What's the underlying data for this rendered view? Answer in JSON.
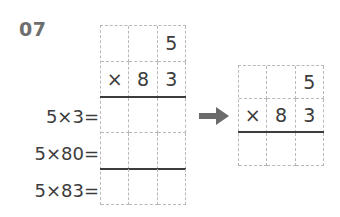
{
  "problem": {
    "number": "07"
  },
  "left_worksheet": {
    "name": "expanded-multiplication-grid",
    "columns": 3,
    "rows": 5,
    "cells": [
      [
        "",
        "",
        "5"
      ],
      [
        "×",
        "8",
        "3"
      ],
      [
        "",
        "",
        ""
      ],
      [
        "",
        "",
        ""
      ],
      [
        "",
        "",
        ""
      ]
    ],
    "solid_rule_after_rows": [
      2,
      4
    ]
  },
  "right_worksheet": {
    "name": "compact-multiplication-grid",
    "columns": 3,
    "rows": 3,
    "cells": [
      [
        "",
        "",
        "5"
      ],
      [
        "×",
        "8",
        "3"
      ],
      [
        "",
        "",
        ""
      ]
    ],
    "solid_rule_after_rows": [
      2
    ]
  },
  "steps": [
    {
      "label": "5×3="
    },
    {
      "label": "5×80="
    },
    {
      "label": "5×83="
    }
  ],
  "arrow": {
    "icon": "arrow-right-icon",
    "direction": "right"
  },
  "colors": {
    "background": "#ffffff",
    "ink": "#3c3c3c",
    "grid_dash": "#b9b9b9",
    "number_label": "#6e6e6e",
    "arrow": "#6b6b6b"
  },
  "chart_data": {
    "type": "table",
    "title": "07",
    "multiplicand": 83,
    "multiplier": 5,
    "partial_products": [
      {
        "expression": "5×3=",
        "value": null
      },
      {
        "expression": "5×80=",
        "value": null
      },
      {
        "expression": "5×83=",
        "value": null
      }
    ],
    "grids": [
      {
        "name": "expanded",
        "rows": 5,
        "columns": 3,
        "cells": [
          [
            "",
            "",
            "5"
          ],
          [
            "×",
            "8",
            "3"
          ],
          [
            "",
            "",
            ""
          ],
          [
            "",
            "",
            ""
          ],
          [
            "",
            "",
            ""
          ]
        ]
      },
      {
        "name": "compact",
        "rows": 3,
        "columns": 3,
        "cells": [
          [
            "",
            "",
            "5"
          ],
          [
            "×",
            "8",
            "3"
          ],
          [
            "",
            "",
            ""
          ]
        ]
      }
    ]
  }
}
